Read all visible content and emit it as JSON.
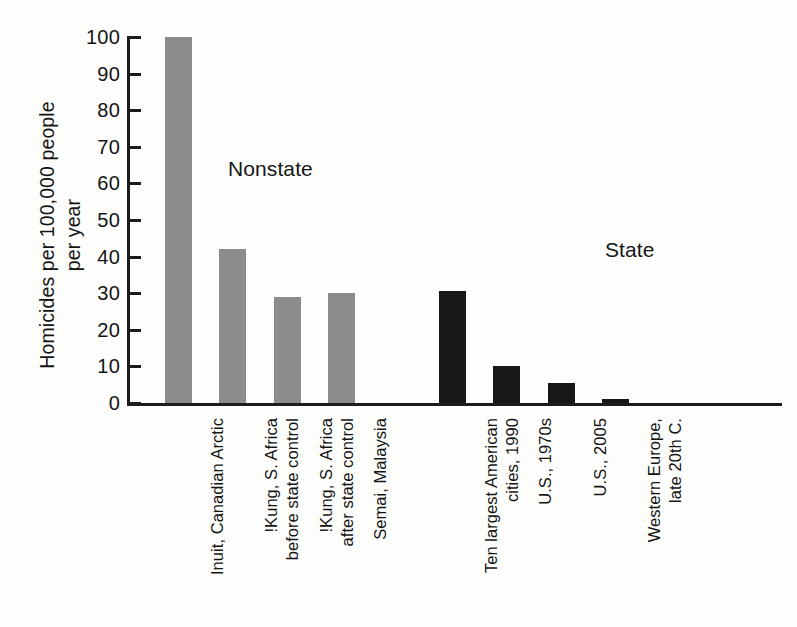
{
  "chart_data": {
    "type": "bar",
    "title": "",
    "xlabel": "",
    "ylabel_lines": [
      "Homicides per 100,000 people",
      "per year"
    ],
    "ylabel": "Homicides per 100,000 people per year",
    "ylim": [
      0,
      100
    ],
    "yticks": [
      0,
      10,
      20,
      30,
      40,
      50,
      60,
      70,
      80,
      90,
      100
    ],
    "ytick_labels": [
      "0",
      "10",
      "20",
      "30",
      "40",
      "50",
      "60",
      "70",
      "80",
      "90",
      "100"
    ],
    "grid": false,
    "legend": "none",
    "group_labels": [
      {
        "name": "nonstate",
        "text": "Nonstate"
      },
      {
        "name": "state",
        "text": "State"
      }
    ],
    "categories": [
      "Inuit, Canadian Arctic",
      "!Kung, S. Africa before state control",
      "!Kung, S. Africa after state control",
      "Semai, Malaysia",
      "Ten largest American cities, 1990",
      "U.S., 1970s",
      "U.S., 2005",
      "Western Europe, late 20th C."
    ],
    "values": [
      100,
      42,
      29,
      30,
      30.5,
      10,
      5.5,
      1
    ],
    "bars": [
      {
        "category": "Inuit, Canadian Arctic",
        "label_lines": [
          "Inuit, Canadian Arctic"
        ],
        "value": 100,
        "group": "nonstate",
        "color": "#8b8b8b"
      },
      {
        "category": "!Kung, S. Africa before state control",
        "label_lines": [
          "!Kung, S. Africa",
          "before state control"
        ],
        "value": 42,
        "group": "nonstate",
        "color": "#8b8b8b"
      },
      {
        "category": "!Kung, S. Africa after state control",
        "label_lines": [
          "!Kung, S. Africa",
          "after state control"
        ],
        "value": 29,
        "group": "nonstate",
        "color": "#8b8b8b"
      },
      {
        "category": "Semai, Malaysia",
        "label_lines": [
          "Semai, Malaysia"
        ],
        "value": 30,
        "group": "nonstate",
        "color": "#8b8b8b"
      },
      {
        "category": "Ten largest American cities, 1990",
        "label_lines": [
          "Ten largest American",
          "cities, 1990"
        ],
        "value": 30.5,
        "group": "state",
        "color": "#171717"
      },
      {
        "category": "U.S., 1970s",
        "label_lines": [
          "U.S., 1970s"
        ],
        "value": 10,
        "group": "state",
        "color": "#171717"
      },
      {
        "category": "U.S., 2005",
        "label_lines": [
          "U.S., 2005"
        ],
        "value": 5.5,
        "group": "state",
        "color": "#171717"
      },
      {
        "category": "Western Europe, late 20th C.",
        "label_lines": [
          "Western Europe,",
          "late 20th C."
        ],
        "value": 1,
        "group": "state",
        "color": "#171717"
      }
    ],
    "colors": {
      "nonstate_bar": "#8b8b8b",
      "state_bar": "#171717",
      "axis": "#1c1c1c",
      "text": "#141414",
      "background": "#fdfdfc"
    }
  }
}
